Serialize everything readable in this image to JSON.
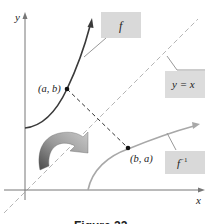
{
  "figure": {
    "caption": "Figure 22",
    "axes": {
      "x_label": "x",
      "y_label": "y"
    },
    "curves": {
      "f": {
        "label": "f",
        "color": "#3a3a3a"
      },
      "f_inverse": {
        "label": "f",
        "label_superscript": "−1",
        "color": "#a8a8a8"
      },
      "identity": {
        "label": "y = x",
        "color": "#b0b0b0"
      }
    },
    "points": {
      "on_f": "(a, b)",
      "on_f_inverse": "(b, a)"
    },
    "label_box_color": "#d9d9d9",
    "reflection_arrow": {
      "meaning": "reflection across y = x"
    }
  }
}
